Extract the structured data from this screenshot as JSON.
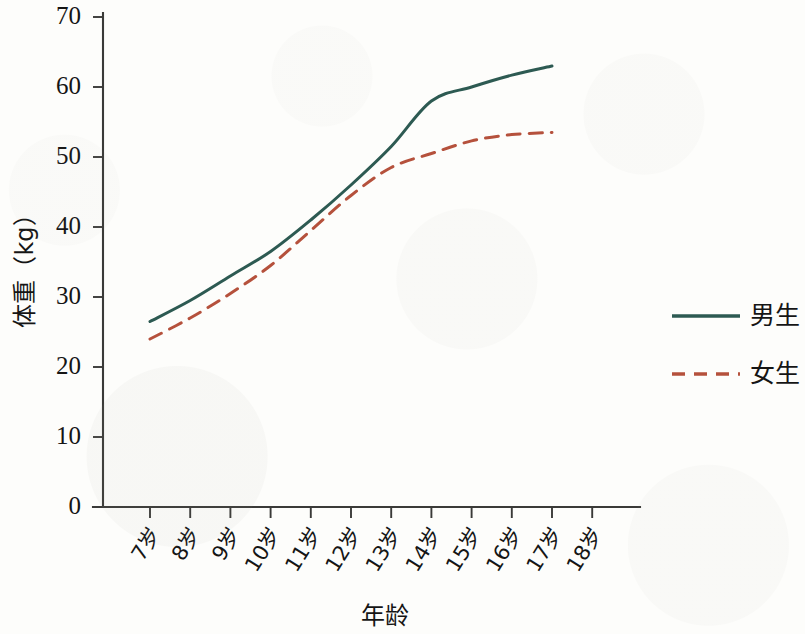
{
  "chart_data": {
    "type": "line",
    "title": "",
    "xlabel": "年龄",
    "ylabel": "体重（kg）",
    "x": [
      "7岁",
      "8岁",
      "9岁",
      "10岁",
      "11岁",
      "12岁",
      "13岁",
      "14岁",
      "15岁",
      "16岁",
      "17岁",
      "18岁"
    ],
    "x_values": [
      7,
      8,
      9,
      10,
      11,
      12,
      13,
      14,
      15,
      16,
      17,
      18
    ],
    "xlim": [
      7,
      18
    ],
    "ylim": [
      0,
      70
    ],
    "y_ticks": [
      0,
      10,
      20,
      30,
      40,
      50,
      60,
      70
    ],
    "y_tick_labels": [
      "0",
      "10",
      "20",
      "30",
      "40",
      "50",
      "60",
      "70"
    ],
    "grid": false,
    "legend_position": "right",
    "series": [
      {
        "name": "男生",
        "color": "#2d5a52",
        "style": "solid",
        "width": 3.0,
        "values": [
          26.5,
          29.5,
          33.0,
          36.5,
          41.0,
          46.0,
          51.5,
          58.0,
          60.0,
          61.7,
          63.0,
          null
        ]
      },
      {
        "name": "女生",
        "color": "#b5513c",
        "style": "dashed",
        "width": 3.0,
        "values": [
          24.0,
          27.0,
          30.5,
          34.5,
          39.5,
          44.5,
          48.5,
          50.5,
          52.3,
          53.2,
          53.5,
          null
        ]
      }
    ]
  },
  "legend": {
    "entries": [
      {
        "label": "男生",
        "color": "#2d5a52",
        "style": "solid"
      },
      {
        "label": "女生",
        "color": "#b5513c",
        "style": "dashed"
      }
    ]
  },
  "axes": {
    "y_axis_title": "体重（kg）",
    "x_axis_title": "年龄"
  }
}
